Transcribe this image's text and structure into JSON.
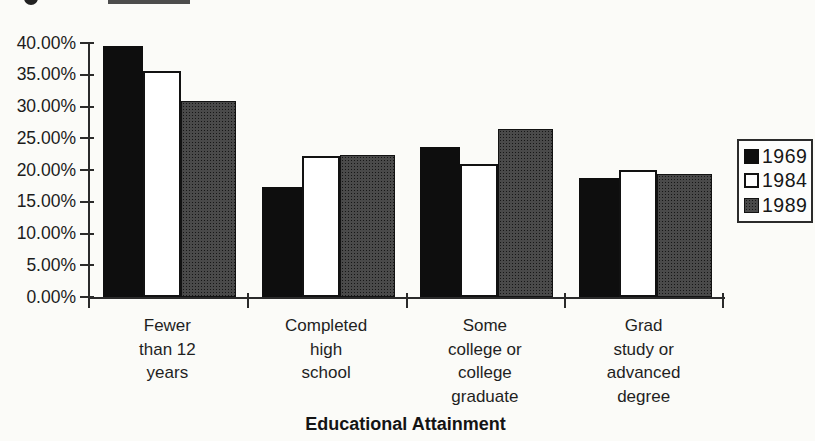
{
  "chart_data": {
    "type": "bar",
    "title": "",
    "xlabel": "Educational Attainment",
    "ylabel": "",
    "categories": [
      "Fewer\nthan 12\nyears",
      "Completed\nhigh\nschool",
      "Some\ncollege or\ncollege\ngraduate",
      "Grad\nstudy or\nadvanced\ndegree"
    ],
    "series": [
      {
        "name": "1969",
        "color": "#0e0e0e",
        "values": [
          39.6,
          17.3,
          23.7,
          18.7
        ]
      },
      {
        "name": "1984",
        "color": "#ffffff",
        "values": [
          35.6,
          22.2,
          21.0,
          20.0
        ]
      },
      {
        "name": "1989",
        "color": "#4a4a4a",
        "values": [
          30.9,
          22.4,
          26.4,
          19.3
        ]
      }
    ],
    "ylim": [
      0,
      40
    ],
    "ytick_step": 5,
    "ytick_labels": [
      "0.00%",
      "5.00%",
      "10.00%",
      "15.00%",
      "20.00%",
      "25.00%",
      "30.00%",
      "35.00%",
      "40.00%"
    ],
    "legend_position": "right",
    "grid": false,
    "colors": {
      "axis": "#2b2b2b",
      "background": "#fbfbf8",
      "text": "#1c1c1c"
    }
  }
}
